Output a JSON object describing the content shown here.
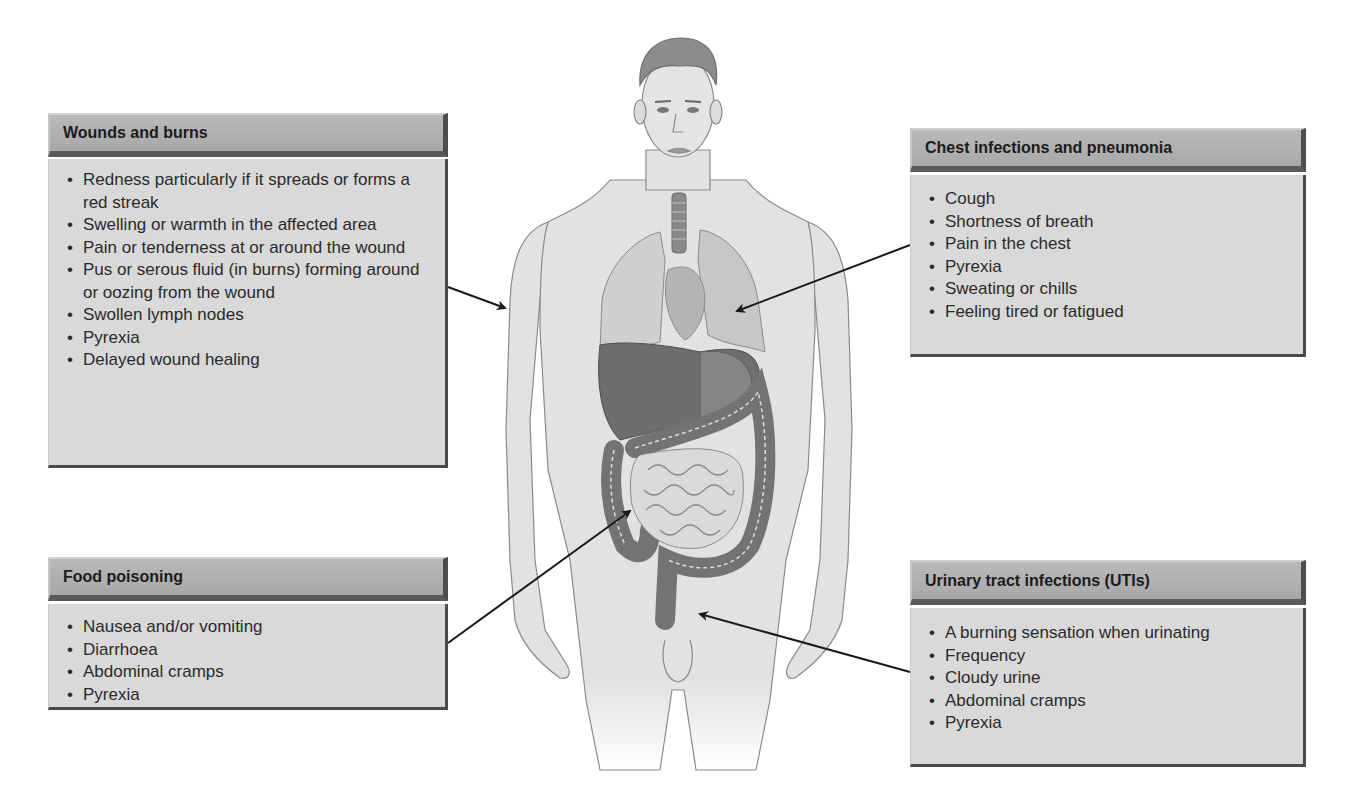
{
  "diagram": {
    "panels": {
      "wounds": {
        "title": "Wounds and burns",
        "items": [
          "Redness particularly if it spreads or forms a red streak",
          "Swelling or warmth in the affected area",
          "Pain or tenderness at or around the wound",
          "Pus or serous fluid (in burns) forming around or oozing from the wound",
          "Swollen lymph nodes",
          "Pyrexia",
          "Delayed wound healing"
        ],
        "points_to": "arm / skin"
      },
      "chest": {
        "title": "Chest infections and pneumonia",
        "items": [
          "Cough",
          "Shortness of breath",
          "Pain in the chest",
          "Pyrexia",
          "Sweating or chills",
          "Feeling tired or fatigued"
        ],
        "points_to": "left lung"
      },
      "food": {
        "title": "Food poisoning",
        "items": [
          "Nausea and/or vomiting",
          "Diarrhoea",
          "Abdominal cramps",
          "Pyrexia"
        ],
        "points_to": "intestines"
      },
      "uti": {
        "title": "Urinary tract infections (UTIs)",
        "items": [
          "A burning sensation when urinating",
          "Frequency",
          "Cloudy urine",
          "Abdominal cramps",
          "Pyrexia"
        ],
        "points_to": "urinary tract"
      }
    },
    "colors": {
      "panel_header": "#b0b0b0",
      "panel_body": "#d9d9d9",
      "panel_shadow": "#4a4a4a",
      "skin": "#e2e2e2",
      "organ_dark": "#6a6a6a",
      "organ_mid": "#9a9a9a",
      "arrow": "#1a1a1a"
    }
  }
}
